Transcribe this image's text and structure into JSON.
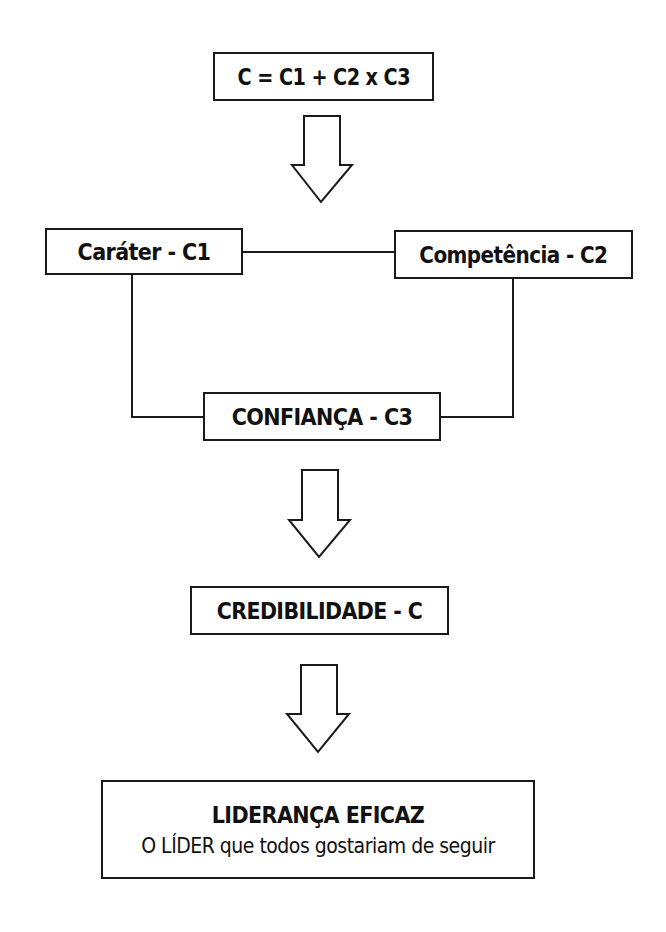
{
  "diagram": {
    "formula": "C = C1 + C2 x C3",
    "nodes": {
      "carater": "Caráter - C1",
      "competencia": "Competência - C2",
      "confianca": "CONFIANÇA - C3",
      "credibilidade": "CREDIBILIDADE - C",
      "lideranca_title": "LIDERANÇA EFICAZ",
      "lideranca_subtitle": "O LÍDER que todos gostariam de seguir"
    },
    "edges": [
      {
        "from": "formula",
        "to": "carater/competencia",
        "type": "block-arrow-down"
      },
      {
        "from": "carater",
        "to": "competencia",
        "type": "line"
      },
      {
        "from": "carater",
        "to": "confianca",
        "type": "elbow-line"
      },
      {
        "from": "competencia",
        "to": "confianca",
        "type": "elbow-line"
      },
      {
        "from": "confianca",
        "to": "credibilidade",
        "type": "block-arrow-down"
      },
      {
        "from": "credibilidade",
        "to": "lideranca",
        "type": "block-arrow-down"
      }
    ],
    "colors": {
      "stroke": "#1a1a1a",
      "fill": "#ffffff",
      "text": "#111111"
    }
  }
}
